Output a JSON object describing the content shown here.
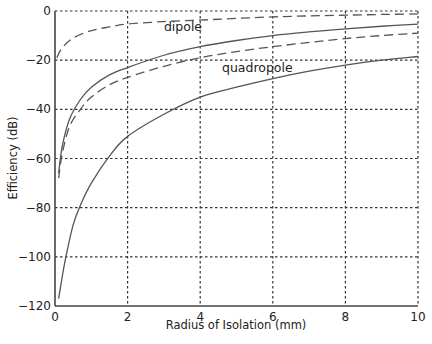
{
  "chart_data": {
    "type": "line",
    "title": "",
    "xlabel": "Radius of Isolation (mm)",
    "ylabel": "Efficiency (dB)",
    "xlim": [
      0,
      10
    ],
    "ylim": [
      -120,
      0
    ],
    "xticks": [
      0,
      2,
      4,
      6,
      8,
      10
    ],
    "yticks": [
      0,
      -20,
      -40,
      -60,
      -80,
      -100,
      -120
    ],
    "xtick_labels": [
      "0",
      "2",
      "4",
      "6",
      "8",
      "10"
    ],
    "ytick_labels": [
      "0",
      "−20",
      "−40",
      "−60",
      "−80",
      "−100",
      "−120"
    ],
    "grid": true,
    "grid_style": "dotted",
    "legend": "none",
    "annotations": [
      {
        "text": "dipole",
        "x": 3.0,
        "y": -8
      },
      {
        "text": "quadropole",
        "x": 4.6,
        "y": -25
      }
    ],
    "series": [
      {
        "name": "dipole (dashed, upper)",
        "style": "dashed",
        "x": [
          0.05,
          0.2,
          0.5,
          1,
          1.5,
          2,
          3,
          4,
          5,
          6,
          7,
          8,
          9,
          10
        ],
        "values": [
          -19,
          -15,
          -11,
          -8,
          -6.5,
          -5.3,
          -4.3,
          -3.7,
          -3,
          -2.4,
          -2,
          -1.7,
          -1.4,
          -1.2
        ]
      },
      {
        "name": "dipole (solid)",
        "style": "solid",
        "x": [
          0.1,
          0.2,
          0.4,
          0.7,
          1,
          1.5,
          2,
          3,
          4,
          5,
          6,
          7,
          8,
          9,
          10
        ],
        "values": [
          -66,
          -55,
          -44,
          -36,
          -31,
          -26,
          -23,
          -18,
          -14.5,
          -12,
          -10,
          -8.5,
          -7.3,
          -6.2,
          -5.3
        ]
      },
      {
        "name": "quadropole (dashed)",
        "style": "dashed",
        "x": [
          0.1,
          0.2,
          0.4,
          0.7,
          1,
          1.5,
          2,
          3,
          4,
          5,
          6,
          7,
          8,
          9,
          10
        ],
        "values": [
          -68,
          -58,
          -47,
          -40,
          -35,
          -30,
          -27,
          -22.5,
          -19,
          -16.5,
          -14.5,
          -12.8,
          -11.2,
          -10,
          -9
        ]
      },
      {
        "name": "quadropole (solid)",
        "style": "solid",
        "x": [
          0.1,
          0.2,
          0.3,
          0.5,
          0.7,
          1,
          1.5,
          2,
          3,
          4,
          5,
          6,
          7,
          8,
          9,
          10
        ],
        "values": [
          -117,
          -108,
          -100,
          -87,
          -79,
          -70,
          -59,
          -51,
          -42,
          -35,
          -31,
          -27.5,
          -24.5,
          -22,
          -20,
          -18.5
        ]
      }
    ]
  }
}
